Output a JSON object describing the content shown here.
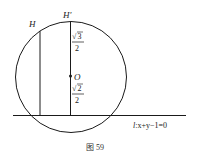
{
  "figure": {
    "caption": "图 59",
    "line_label_l": "l",
    "line_label_eq": ":x+y−1=0",
    "points": {
      "H": "H",
      "H_prime": "H′",
      "O": "O"
    },
    "distances": {
      "upper": {
        "radicand": "3",
        "denominator": "2"
      },
      "lower": {
        "radicand": "2",
        "denominator": "2"
      }
    },
    "colors": {
      "stroke": "#1a1a1a",
      "background": "#ffffff"
    }
  }
}
